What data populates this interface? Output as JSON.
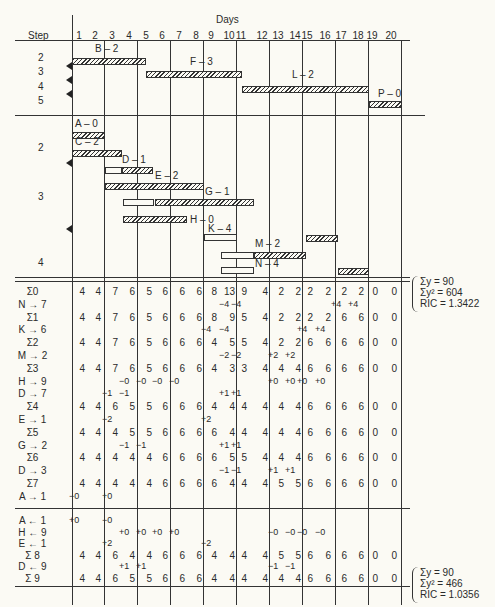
{
  "header": {
    "step_label": "Step",
    "days_label": "Days",
    "days": [
      "1",
      "2",
      "3",
      "4",
      "5",
      "6",
      "7",
      "8",
      "9",
      "10",
      "11",
      "12",
      "13",
      "14",
      "15",
      "16",
      "17",
      "18",
      "19",
      "20"
    ]
  },
  "gantt_top": {
    "step_labels": [
      "2",
      "3",
      "4",
      "5"
    ],
    "activities": [
      {
        "label": "B – 2",
        "start": 1,
        "end": 5.5,
        "type": "hatched"
      },
      {
        "label": "F – 3",
        "start": 5.5,
        "end": 11.3,
        "type": "hatched"
      },
      {
        "label": "L – 2",
        "start": 11.3,
        "end": 19,
        "type": "hatched"
      },
      {
        "label": "P – 0",
        "start": 19,
        "end": 21,
        "type": "hatched"
      }
    ]
  },
  "gantt_bottom": {
    "step_labels": [
      "2",
      "3",
      "4"
    ],
    "activities": [
      {
        "label": "A – 0",
        "segments": [
          {
            "start": 1,
            "end": 3,
            "type": "hatched"
          }
        ]
      },
      {
        "label": "C – 2",
        "segments": [
          {
            "start": 1,
            "end": 4,
            "type": "hatched"
          }
        ]
      },
      {
        "label": "D – 1",
        "segments": [
          {
            "start": 3,
            "end": 4,
            "type": "open"
          },
          {
            "start": 4,
            "end": 5.9,
            "type": "hatched"
          }
        ]
      },
      {
        "label": "E – 2",
        "segments": [
          {
            "start": 3,
            "end": 9,
            "type": "hatched"
          }
        ]
      },
      {
        "label": "G – 1",
        "segments": [
          {
            "start": 4.1,
            "end": 6,
            "type": "open"
          },
          {
            "start": 6,
            "end": 12,
            "type": "hatched"
          }
        ]
      },
      {
        "label": "H – 0",
        "segments": [
          {
            "start": 4.1,
            "end": 8,
            "type": "hatched"
          }
        ]
      },
      {
        "label": "K – 4",
        "segments": [
          {
            "start": 9,
            "end": 11,
            "type": "open"
          }
        ]
      },
      {
        "label": "M – 2",
        "segments": [
          {
            "start": 10,
            "end": 12,
            "type": "open"
          },
          {
            "start": 12,
            "end": 15.2,
            "type": "hatched"
          }
        ]
      },
      {
        "label": "",
        "segments": [
          {
            "start": 15.2,
            "end": 17.1,
            "type": "hatched"
          }
        ]
      },
      {
        "label": "N – 4",
        "segments": [
          {
            "start": 10,
            "end": 12,
            "type": "open"
          }
        ]
      },
      {
        "label": "",
        "segments": [
          {
            "start": 17.1,
            "end": 19,
            "type": "hatched"
          }
        ]
      }
    ]
  },
  "table": {
    "rows": [
      {
        "label": "Σ0",
        "values": [
          "4",
          "4",
          "7",
          "6",
          "5",
          "6",
          "6",
          "6",
          "8",
          "13",
          "9",
          "4",
          "2",
          "2",
          "2",
          "2",
          "2",
          "2",
          "0",
          "0"
        ]
      },
      {
        "label": "N → 7",
        "deltas": {
          "10": "−4",
          "11": "−4",
          "17": "+4",
          "18": "+4"
        }
      },
      {
        "label": "Σ1",
        "values": [
          "4",
          "4",
          "7",
          "6",
          "5",
          "6",
          "6",
          "6",
          "8",
          "9",
          "5",
          "4",
          "2",
          "2",
          "2",
          "2",
          "6",
          "6",
          "0",
          "0"
        ]
      },
      {
        "label": "K → 6",
        "deltas": {
          "9": "−4",
          "10": "−4",
          "15": "+4",
          "16": "+4"
        }
      },
      {
        "label": "Σ2",
        "values": [
          "4",
          "4",
          "7",
          "6",
          "5",
          "6",
          "6",
          "6",
          "4",
          "5",
          "5",
          "4",
          "2",
          "2",
          "6",
          "6",
          "6",
          "6",
          "0",
          "0"
        ]
      },
      {
        "label": "M → 2",
        "deltas": {
          "10": "−2",
          "11": "−2",
          "13": "+2",
          "14": "+2"
        }
      },
      {
        "label": "Σ3",
        "values": [
          "4",
          "4",
          "7",
          "6",
          "5",
          "6",
          "6",
          "6",
          "4",
          "3",
          "3",
          "4",
          "4",
          "4",
          "6",
          "6",
          "6",
          "6",
          "0",
          "0"
        ]
      },
      {
        "label": "H → 9",
        "deltas": {
          "4": "−0",
          "5": "−0",
          "6": "−0",
          "7": "−0",
          "13": "+0",
          "14": "+0",
          "15": "+0",
          "16": "+0"
        }
      },
      {
        "label": "D → 7",
        "deltas": {
          "3": "−1",
          "4": "−1",
          "10": "+1",
          "11": "+1"
        }
      },
      {
        "label": "Σ4",
        "values": [
          "4",
          "4",
          "6",
          "5",
          "5",
          "6",
          "6",
          "6",
          "4",
          "4",
          "4",
          "4",
          "4",
          "4",
          "6",
          "6",
          "6",
          "6",
          "0",
          "0"
        ]
      },
      {
        "label": "E → 1",
        "deltas": {
          "3": "−2",
          "9": "+2"
        }
      },
      {
        "label": "Σ5",
        "values": [
          "4",
          "4",
          "4",
          "5",
          "5",
          "6",
          "6",
          "6",
          "6",
          "4",
          "4",
          "4",
          "4",
          "4",
          "6",
          "6",
          "6",
          "6",
          "0",
          "0"
        ]
      },
      {
        "label": "G → 2",
        "deltas": {
          "4": "−1",
          "5": "−1",
          "10": "+1",
          "11": "+1"
        }
      },
      {
        "label": "Σ6",
        "values": [
          "4",
          "4",
          "4",
          "4",
          "4",
          "6",
          "6",
          "6",
          "6",
          "5",
          "5",
          "4",
          "4",
          "4",
          "6",
          "6",
          "6",
          "6",
          "0",
          "0"
        ]
      },
      {
        "label": "D → 3",
        "deltas": {
          "10": "−1",
          "11": "−1",
          "13": "+1",
          "14": "+1"
        }
      },
      {
        "label": "Σ7",
        "values": [
          "4",
          "4",
          "4",
          "4",
          "4",
          "6",
          "6",
          "6",
          "6",
          "4",
          "4",
          "4",
          "5",
          "5",
          "6",
          "6",
          "6",
          "6",
          "0",
          "0"
        ]
      },
      {
        "label": "A → 1",
        "deltas": {
          "1": "−0",
          "3": "+0"
        }
      }
    ],
    "rows2": [
      {
        "label": "A ← 1",
        "deltas": {
          "1": "+0",
          "3": "−0"
        }
      },
      {
        "label": "H ← 9",
        "deltas": {
          "4": "+0",
          "5": "+0",
          "6": "+0",
          "7": "+0",
          "13": "−0",
          "14": "−0",
          "15": "−0",
          "16": "−0"
        }
      },
      {
        "label": "E ← 1",
        "deltas": {
          "3": "+2",
          "9": "−2"
        }
      },
      {
        "label": "Σ 8",
        "values": [
          "4",
          "4",
          "6",
          "4",
          "4",
          "6",
          "6",
          "6",
          "4",
          "4",
          "4",
          "4",
          "5",
          "5",
          "6",
          "6",
          "6",
          "6",
          "0",
          "0"
        ]
      },
      {
        "label": "D ← 9",
        "deltas": {
          "4": "+1",
          "5": "+1",
          "13": "−1",
          "14": "−1"
        }
      },
      {
        "label": "Σ 9",
        "values": [
          "4",
          "4",
          "6",
          "5",
          "5",
          "6",
          "6",
          "6",
          "4",
          "4",
          "4",
          "4",
          "4",
          "4",
          "6",
          "6",
          "6",
          "6",
          "0",
          "0"
        ]
      }
    ]
  },
  "stats": [
    {
      "sum_y": "Σy = 90",
      "sum_y2": "Σy² = 604",
      "ric": "RIC = 1.3422"
    },
    {
      "sum_y": "Σy = 90",
      "sum_y2": "Σy² = 466",
      "ric": "RIC = 1.0356"
    }
  ]
}
